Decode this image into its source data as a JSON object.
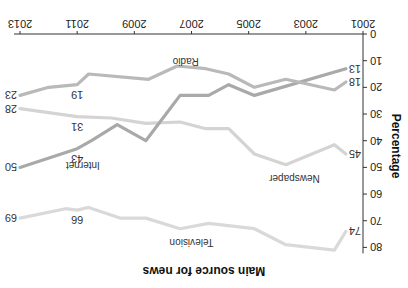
{
  "chart_data": {
    "type": "line",
    "title": "Main source for news",
    "xlabel": "",
    "ylabel": "Percentage",
    "xlim": [
      2001,
      2013
    ],
    "ylim": [
      0,
      80
    ],
    "x_ticks": [
      2001,
      2003,
      2005,
      2007,
      2009,
      2011,
      2013
    ],
    "y_ticks": [
      0,
      10,
      20,
      30,
      40,
      50,
      60,
      70,
      80
    ],
    "grid": false,
    "legend": "inline labels",
    "orientation_note": "image displayed rotated 180 degrees",
    "series": [
      {
        "name": "Television",
        "color": "#d9d9d9",
        "points": [
          [
            2001.6,
            74
          ],
          [
            2002.0,
            81
          ],
          [
            2003.7,
            79
          ],
          [
            2004.8,
            73
          ],
          [
            2006.4,
            71
          ],
          [
            2007.4,
            73
          ],
          [
            2008.6,
            69
          ],
          [
            2009.5,
            69
          ],
          [
            2010.6,
            65
          ],
          [
            2011.0,
            66
          ],
          [
            2011.4,
            65.5
          ],
          [
            2013.0,
            69
          ]
        ],
        "labels": [
          {
            "x": 2001.6,
            "value": 74,
            "text": "74"
          },
          {
            "x": 2011.0,
            "value": 66,
            "text": "66"
          },
          {
            "x": 2013.0,
            "value": 69,
            "text": "69"
          }
        ],
        "name_pos": [
          2007.0,
          77
        ]
      },
      {
        "name": "Newspaper",
        "color": "#d4d4d4",
        "points": [
          [
            2001.6,
            45
          ],
          [
            2002.0,
            41.5
          ],
          [
            2003.7,
            49
          ],
          [
            2004.8,
            45
          ],
          [
            2005.7,
            35.5
          ],
          [
            2006.5,
            35.5
          ],
          [
            2007.4,
            33
          ],
          [
            2008.6,
            33.5
          ],
          [
            2009.8,
            31.5
          ],
          [
            2011.0,
            31
          ],
          [
            2013.0,
            28
          ]
        ],
        "labels": [
          {
            "x": 2001.6,
            "value": 45,
            "text": "45"
          },
          {
            "x": 2011.0,
            "value": 31,
            "text": "31"
          },
          {
            "x": 2013.0,
            "value": 28,
            "text": "28"
          }
        ],
        "name_pos": [
          2003.4,
          53
        ]
      },
      {
        "name": "Internet",
        "color": "#a9a9a9",
        "points": [
          [
            2001.6,
            13
          ],
          [
            2004.8,
            23
          ],
          [
            2005.7,
            19
          ],
          [
            2006.4,
            23
          ],
          [
            2007.4,
            23
          ],
          [
            2008.6,
            40
          ],
          [
            2009.6,
            34
          ],
          [
            2010.5,
            40
          ],
          [
            2011.0,
            43
          ],
          [
            2013.0,
            50
          ]
        ],
        "labels": [
          {
            "x": 2001.6,
            "value": 13,
            "text": "13"
          },
          {
            "x": 2011.0,
            "value": 43,
            "text": "43"
          },
          {
            "x": 2013.0,
            "value": 50,
            "text": "50"
          }
        ],
        "name_pos": [
          2010.8,
          48
        ]
      },
      {
        "name": "Radio",
        "color": "#b9b9b9",
        "points": [
          [
            2001.6,
            18
          ],
          [
            2002.0,
            21
          ],
          [
            2003.7,
            17
          ],
          [
            2004.8,
            20
          ],
          [
            2005.7,
            15
          ],
          [
            2006.5,
            13
          ],
          [
            2007.5,
            12
          ],
          [
            2008.5,
            17
          ],
          [
            2010.6,
            15
          ],
          [
            2011.0,
            19
          ],
          [
            2012.0,
            20
          ],
          [
            2013.0,
            23
          ]
        ],
        "labels": [
          {
            "x": 2001.6,
            "value": 18,
            "text": "18"
          },
          {
            "x": 2011.0,
            "value": 19,
            "text": "19"
          },
          {
            "x": 2013.0,
            "value": 23,
            "text": "23"
          }
        ],
        "name_pos": [
          2007.2,
          9
        ]
      }
    ]
  }
}
